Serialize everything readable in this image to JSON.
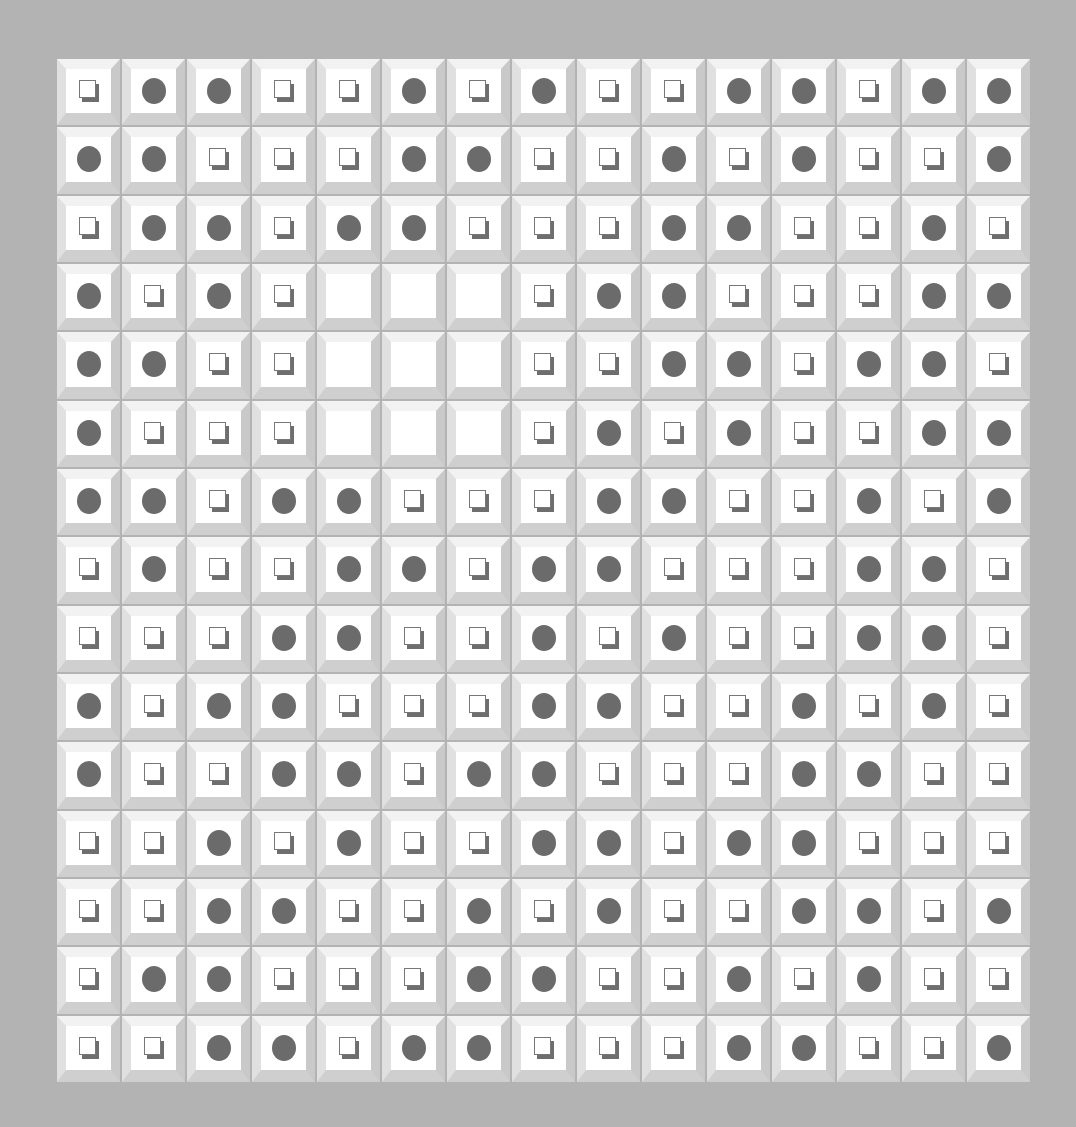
{
  "game": {
    "rows": 15,
    "cols": 15,
    "legend": {
      "S": "square-tile",
      "C": "circle-tile",
      "E": "empty-tile"
    },
    "colors": {
      "background": "#b3b3b3",
      "bevel_light": "#f2f2f2",
      "bevel_dark": "#c9c9c9",
      "cell_face": "#ffffff",
      "circle": "#6b6b6b",
      "square_shadow": "#6e6e6e"
    },
    "grid": [
      [
        "S",
        "C",
        "C",
        "S",
        "S",
        "C",
        "S",
        "C",
        "S",
        "S",
        "C",
        "C",
        "S",
        "C",
        "C"
      ],
      [
        "C",
        "C",
        "S",
        "S",
        "S",
        "C",
        "C",
        "S",
        "S",
        "C",
        "S",
        "C",
        "S",
        "S",
        "C"
      ],
      [
        "S",
        "C",
        "C",
        "S",
        "C",
        "C",
        "S",
        "S",
        "S",
        "C",
        "C",
        "S",
        "S",
        "C",
        "S"
      ],
      [
        "C",
        "S",
        "C",
        "S",
        "E",
        "E",
        "E",
        "S",
        "C",
        "C",
        "S",
        "S",
        "S",
        "C",
        "C"
      ],
      [
        "C",
        "C",
        "S",
        "S",
        "E",
        "E",
        "E",
        "S",
        "S",
        "C",
        "C",
        "S",
        "C",
        "C",
        "S"
      ],
      [
        "C",
        "S",
        "S",
        "S",
        "E",
        "E",
        "E",
        "S",
        "C",
        "S",
        "C",
        "S",
        "S",
        "C",
        "C"
      ],
      [
        "C",
        "C",
        "S",
        "C",
        "C",
        "S",
        "S",
        "S",
        "C",
        "C",
        "S",
        "S",
        "C",
        "S",
        "C"
      ],
      [
        "S",
        "C",
        "S",
        "S",
        "C",
        "C",
        "S",
        "C",
        "C",
        "S",
        "S",
        "S",
        "C",
        "C",
        "S"
      ],
      [
        "S",
        "S",
        "S",
        "C",
        "C",
        "S",
        "S",
        "C",
        "S",
        "C",
        "S",
        "S",
        "C",
        "C",
        "S"
      ],
      [
        "C",
        "S",
        "C",
        "C",
        "S",
        "S",
        "S",
        "C",
        "C",
        "S",
        "S",
        "C",
        "S",
        "C",
        "S"
      ],
      [
        "C",
        "S",
        "S",
        "C",
        "C",
        "S",
        "C",
        "C",
        "S",
        "S",
        "S",
        "C",
        "C",
        "S",
        "S"
      ],
      [
        "S",
        "S",
        "C",
        "S",
        "C",
        "S",
        "S",
        "C",
        "C",
        "S",
        "C",
        "C",
        "S",
        "S",
        "S"
      ],
      [
        "S",
        "S",
        "C",
        "C",
        "S",
        "S",
        "C",
        "S",
        "C",
        "S",
        "S",
        "C",
        "C",
        "S",
        "C"
      ],
      [
        "S",
        "C",
        "C",
        "S",
        "S",
        "S",
        "C",
        "C",
        "S",
        "S",
        "C",
        "S",
        "C",
        "S",
        "S"
      ],
      [
        "S",
        "S",
        "C",
        "C",
        "S",
        "C",
        "C",
        "S",
        "S",
        "S",
        "C",
        "C",
        "S",
        "S",
        "C"
      ]
    ]
  }
}
